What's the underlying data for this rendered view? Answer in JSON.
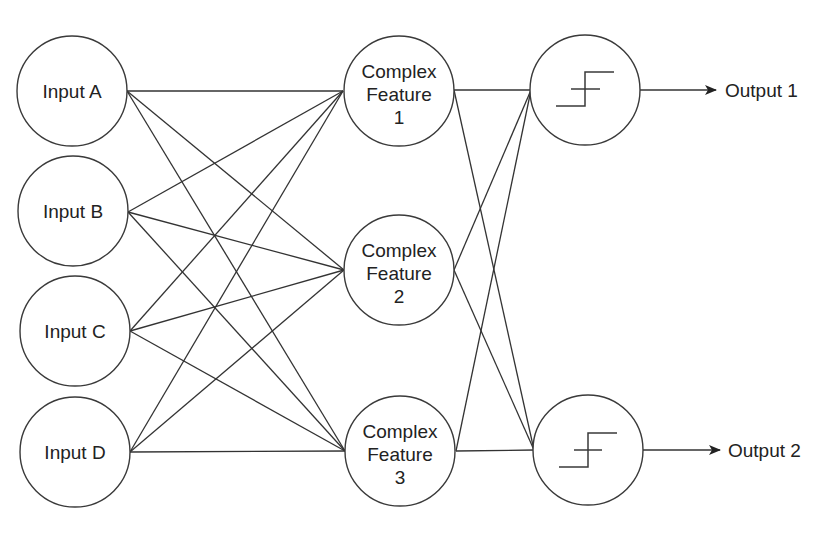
{
  "diagram": {
    "type": "neural-network",
    "colors": {
      "stroke": "#3a3a3a",
      "text": "#222222",
      "background": "#ffffff"
    },
    "inputs": [
      {
        "id": "A",
        "label": "Input A",
        "cx": 72,
        "cy": 91
      },
      {
        "id": "B",
        "label": "Input B",
        "cx": 73,
        "cy": 211
      },
      {
        "id": "C",
        "label": "Input C",
        "cx": 74,
        "cy": 331
      },
      {
        "id": "D",
        "label": "Input D",
        "cx": 74,
        "cy": 452
      }
    ],
    "features": [
      {
        "id": "F1",
        "lines": [
          "Complex",
          "Feature",
          "1"
        ],
        "cx": 399,
        "cy": 91
      },
      {
        "id": "F2",
        "lines": [
          "Complex",
          "Feature",
          "2"
        ],
        "cx": 399,
        "cy": 270
      },
      {
        "id": "F3",
        "lines": [
          "Complex",
          "Feature",
          "3"
        ],
        "cx": 400,
        "cy": 451
      }
    ],
    "outputs": [
      {
        "id": "O1",
        "icon": "step-function-icon",
        "label": "Output 1",
        "cx": 585,
        "cy": 90
      },
      {
        "id": "O2",
        "icon": "step-function-icon",
        "label": "Output 2",
        "cx": 588,
        "cy": 450
      }
    ],
    "edges": {
      "input_to_feature": "fully-connected (4 x 3)",
      "feature_to_output": "fully-connected (3 x 2)"
    }
  }
}
